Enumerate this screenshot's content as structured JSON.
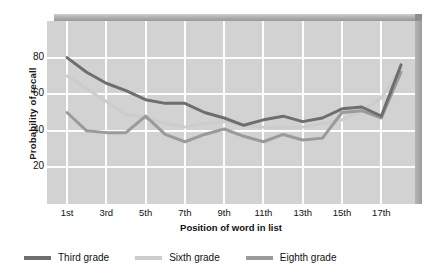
{
  "chart_data": {
    "type": "line",
    "title": "",
    "xlabel": "Position of word in list",
    "ylabel": "Probability of recall",
    "xlim": [
      1,
      18
    ],
    "ylim": [
      0,
      100
    ],
    "yticks": [
      20,
      40,
      60,
      80
    ],
    "xticks": [
      "1st",
      "3rd",
      "5th",
      "7th",
      "9th",
      "11th",
      "13th",
      "15th",
      "17th"
    ],
    "xtick_values": [
      1,
      3,
      5,
      7,
      9,
      11,
      13,
      15,
      17
    ],
    "x": [
      1,
      2,
      3,
      4,
      5,
      6,
      7,
      8,
      9,
      10,
      11,
      12,
      13,
      14,
      15,
      16,
      17,
      18
    ],
    "grid": true,
    "legend_position": "bottom",
    "series": [
      {
        "name": "Third grade",
        "color": "#6e6e6e",
        "values": [
          80,
          72,
          66,
          62,
          57,
          55,
          55,
          50,
          47,
          43,
          46,
          48,
          45,
          47,
          52,
          53,
          48,
          76
        ]
      },
      {
        "name": "Sixth grade",
        "color": "#cccccc",
        "values": [
          70,
          63,
          56,
          49,
          47,
          44,
          42,
          44,
          45,
          43,
          42,
          42,
          42,
          44,
          46,
          51,
          58,
          74
        ]
      },
      {
        "name": "Eighth grade",
        "color": "#9a9a9a",
        "values": [
          50,
          40,
          39,
          39,
          48,
          38,
          34,
          38,
          41,
          37,
          34,
          38,
          35,
          36,
          50,
          51,
          47,
          72
        ]
      }
    ]
  },
  "axes": {
    "y_title": "Probability of recall",
    "x_title": "Position of word in list"
  },
  "legend": {
    "items": [
      {
        "label": "Third grade",
        "color": "#6e6e6e"
      },
      {
        "label": "Sixth grade",
        "color": "#cccccc"
      },
      {
        "label": "Eighth grade",
        "color": "#9a9a9a"
      }
    ]
  }
}
